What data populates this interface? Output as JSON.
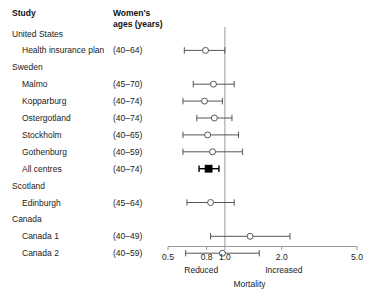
{
  "header": {
    "study_label": "Study",
    "ages_label": "Women's\nages (years)"
  },
  "chart_data": {
    "type": "forest",
    "title": "",
    "xlabel": "Mortality",
    "ylabel": "",
    "xscale": "log",
    "xlim": [
      0.5,
      5.0
    ],
    "xticks": [
      0.5,
      0.8,
      1.0,
      2.0,
      5.0
    ],
    "xticklabels": [
      "0.5",
      "0.8",
      "1.0",
      "2.0",
      "5.0"
    ],
    "reference_line": 1.0,
    "direction_left": "Reduced",
    "direction_right": "Increased",
    "grid": false,
    "legend": "none",
    "rows": [
      {
        "label": "United States",
        "type": "group",
        "ages": "",
        "estimate": null,
        "ci_low": null,
        "ci_high": null,
        "marker": "none"
      },
      {
        "label": "Health insurance plan",
        "type": "study",
        "ages": "(40–64)",
        "estimate": 0.79,
        "ci_low": 0.61,
        "ci_high": 1.0,
        "marker": "open-circle"
      },
      {
        "label": "Sweden",
        "type": "group",
        "ages": "",
        "estimate": null,
        "ci_low": null,
        "ci_high": null,
        "marker": "none"
      },
      {
        "label": "Malmo",
        "type": "study",
        "ages": "(45–70)",
        "estimate": 0.87,
        "ci_low": 0.68,
        "ci_high": 1.12,
        "marker": "open-circle"
      },
      {
        "label": "Kopparburg",
        "type": "study",
        "ages": "(40–74)",
        "estimate": 0.78,
        "ci_low": 0.6,
        "ci_high": 0.97,
        "marker": "open-circle"
      },
      {
        "label": "Ostergotland",
        "type": "study",
        "ages": "(40–74)",
        "estimate": 0.88,
        "ci_low": 0.71,
        "ci_high": 1.09,
        "marker": "open-circle"
      },
      {
        "label": "Stockholm",
        "type": "study",
        "ages": "(40–65)",
        "estimate": 0.81,
        "ci_low": 0.6,
        "ci_high": 1.18,
        "marker": "open-circle"
      },
      {
        "label": "Gothenburg",
        "type": "study",
        "ages": "(40–59)",
        "estimate": 0.86,
        "ci_low": 0.6,
        "ci_high": 1.24,
        "marker": "open-circle"
      },
      {
        "label": "All centres",
        "type": "summary",
        "ages": "(40–74)",
        "estimate": 0.82,
        "ci_low": 0.73,
        "ci_high": 0.93,
        "marker": "filled-square"
      },
      {
        "label": "Scotland",
        "type": "group",
        "ages": "",
        "estimate": null,
        "ci_low": null,
        "ci_high": null,
        "marker": "none"
      },
      {
        "label": "Edinburgh",
        "type": "study",
        "ages": "(45–64)",
        "estimate": 0.84,
        "ci_low": 0.63,
        "ci_high": 1.12,
        "marker": "open-circle"
      },
      {
        "label": "Canada",
        "type": "group",
        "ages": "",
        "estimate": null,
        "ci_low": null,
        "ci_high": null,
        "marker": "none"
      },
      {
        "label": "Canada 1",
        "type": "study",
        "ages": "(40–49)",
        "estimate": 1.36,
        "ci_low": 0.84,
        "ci_high": 2.21,
        "marker": "open-circle"
      },
      {
        "label": "Canada 2",
        "type": "study",
        "ages": "(40–59)",
        "estimate": 0.97,
        "ci_low": 0.62,
        "ci_high": 1.52,
        "marker": "open-circle"
      }
    ]
  },
  "colors": {
    "line": "#555555",
    "summary": "#000000",
    "axis": "#999999",
    "text": "#222222"
  }
}
